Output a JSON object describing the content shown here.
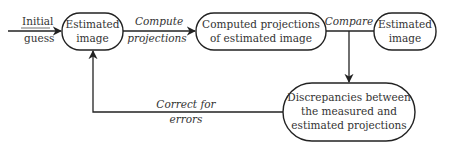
{
  "diagram": {
    "type": "flowchart",
    "nodes": {
      "estimated_image_start": {
        "lines": [
          "Estimated",
          "image"
        ]
      },
      "computed_projections": {
        "lines": [
          "Computed projections",
          "of estimated image"
        ]
      },
      "estimated_image_end": {
        "lines": [
          "Estimated",
          "image"
        ]
      },
      "discrepancies": {
        "lines": [
          "Discrepancies between",
          "the measured and",
          "estimated projections"
        ]
      }
    },
    "edges": {
      "initial_guess": {
        "lines": [
          "Initial",
          "guess"
        ],
        "underlined_first_line": true
      },
      "compute_projections": {
        "lines": [
          "Compute",
          "projections"
        ]
      },
      "compare": {
        "lines": [
          "Compare"
        ]
      },
      "correct_for_errors": {
        "lines": [
          "Correct for",
          "errors"
        ]
      }
    },
    "colors": {
      "stroke": "#222222",
      "text": "#333333",
      "background": "#ffffff"
    }
  }
}
